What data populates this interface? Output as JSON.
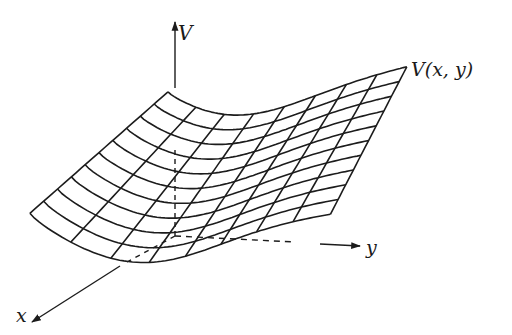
{
  "figure": {
    "labels": {
      "v_axis": "V",
      "x_axis": "x",
      "y_axis": "y",
      "surface": "V(x, y)"
    },
    "colors": {
      "stroke": "#1c1c1c",
      "background": "#ffffff"
    },
    "geometry": {
      "origin": [
        175,
        236
      ],
      "v_axis_top": [
        175,
        22
      ],
      "y_axis_end": [
        360,
        246
      ],
      "x_axis_end": [
        32,
        322
      ],
      "surface_corners": {
        "back_left": [
          171,
          80
        ],
        "back_right": [
          407,
          66
        ],
        "front_left": [
          25,
          195
        ],
        "front_right": [
          330,
          213
        ]
      },
      "grid_rows": 11,
      "grid_cols": 9
    }
  }
}
